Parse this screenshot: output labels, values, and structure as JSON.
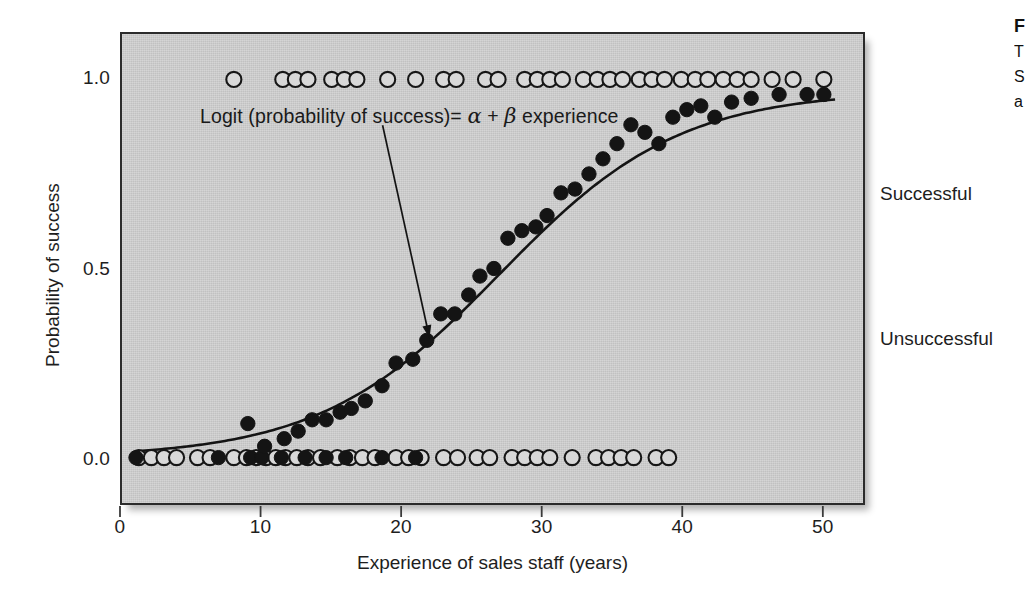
{
  "chart_data": {
    "type": "scatter",
    "title": "",
    "xlabel": "Experience of sales staff (years)",
    "ylabel": "Probability of success",
    "xlim": [
      0,
      53
    ],
    "ylim": [
      -0.12,
      1.12
    ],
    "xticks": [
      0,
      10,
      20,
      30,
      40,
      50
    ],
    "xtick_labels": [
      "0",
      "10",
      "20",
      "30",
      "40",
      "50"
    ],
    "yticks": [
      0.0,
      0.5,
      1.0
    ],
    "ytick_labels": [
      "0.0",
      "0.5",
      "1.0"
    ],
    "grid": false,
    "legend": "none",
    "annotation": {
      "text": "Logit (probability of success)= α + β experience",
      "x": 22.0,
      "y": 0.3
    },
    "right_axis_labels": [
      {
        "label": "Successful",
        "y": 1.0
      },
      {
        "label": "Unsuccessful",
        "y": 0.0
      }
    ],
    "series": [
      {
        "name": "Unsuccessful outcomes (open circles, y = 0)",
        "marker": "open-circle",
        "y": 0.0,
        "x": [
          1.2,
          2.1,
          3.0,
          3.9,
          5.4,
          6.3,
          8.0,
          8.9,
          9.6,
          10.3,
          11.0,
          11.7,
          12.5,
          13.3,
          14.2,
          15.4,
          16.3,
          17.2,
          18.1,
          19.6,
          20.5,
          21.4,
          23.0,
          24.0,
          25.4,
          26.3,
          27.9,
          28.8,
          29.7,
          30.6,
          32.2,
          33.9,
          34.8,
          35.7,
          36.6,
          38.2,
          39.1
        ]
      },
      {
        "name": "Unsuccessful outcomes (filled, fitted y = 0)",
        "marker": "filled-circle",
        "y": 0.0,
        "x": [
          1.0,
          6.9,
          9.2,
          10.0,
          11.4,
          13.1,
          14.6,
          16.0,
          18.6,
          21.0
        ]
      },
      {
        "name": "Successful outcomes (open circles, y = 1)",
        "marker": "open-circle",
        "y": 1.0,
        "x": [
          8.0,
          11.5,
          12.4,
          13.3,
          15.0,
          15.9,
          16.8,
          19.0,
          21.0,
          23.0,
          23.9,
          26.0,
          26.9,
          28.8,
          29.7,
          30.6,
          31.5,
          33.0,
          34.0,
          34.9,
          35.8,
          37.0,
          37.9,
          38.8,
          40.0,
          41.0,
          41.9,
          43.0,
          44.0,
          45.0,
          46.5,
          48.0,
          50.2
        ]
      },
      {
        "name": "Fitted probabilities (filled circles on logistic curve)",
        "marker": "filled-circle",
        "x": [
          9.0,
          10.2,
          11.6,
          12.6,
          13.6,
          14.6,
          15.6,
          16.4,
          17.4,
          18.6,
          19.6,
          20.8,
          21.8,
          22.8,
          23.8,
          24.8,
          25.6,
          26.6,
          27.6,
          28.6,
          29.6,
          30.4,
          31.4,
          32.4,
          33.4,
          34.4,
          35.4,
          36.4,
          37.4,
          38.4,
          39.4,
          40.4,
          41.4,
          42.4,
          43.6,
          45.0,
          47.0,
          49.0,
          50.2
        ],
        "values": [
          0.09,
          0.03,
          0.05,
          0.07,
          0.1,
          0.1,
          0.12,
          0.13,
          0.15,
          0.19,
          0.25,
          0.26,
          0.31,
          0.38,
          0.38,
          0.43,
          0.48,
          0.5,
          0.58,
          0.6,
          0.61,
          0.64,
          0.7,
          0.71,
          0.75,
          0.79,
          0.83,
          0.88,
          0.86,
          0.83,
          0.9,
          0.92,
          0.93,
          0.9,
          0.94,
          0.95,
          0.96,
          0.96,
          0.96
        ]
      }
    ],
    "fit_curve": {
      "name": "Logistic (logit) fit",
      "model": "logit",
      "x_start": 1.0,
      "x_end": 51.0,
      "midpoint_x": 27.0,
      "slope": 0.155,
      "upper_asymptote": 0.97
    }
  },
  "figure_caption": {
    "line1": "F",
    "line2": "T",
    "line3": "S",
    "line4": "a"
  }
}
